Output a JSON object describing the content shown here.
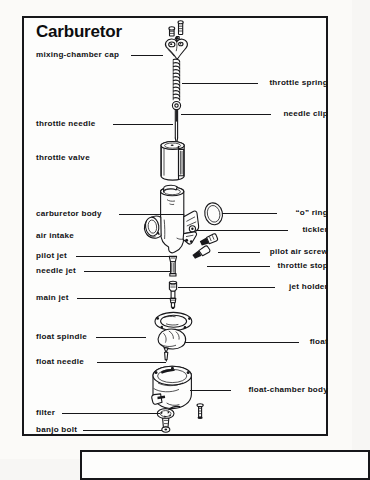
{
  "figure": {
    "title": "Carburetor",
    "labels_left": [
      {
        "text": "mixing-chamber cap",
        "leader": true
      },
      {
        "text": "throttle needle",
        "leader": true
      },
      {
        "text": "throttle valve",
        "leader": false
      },
      {
        "text": "carburetor body",
        "leader": true
      },
      {
        "text": "air intake",
        "leader": false
      },
      {
        "text": "pilot jet",
        "leader": true
      },
      {
        "text": "needle jet",
        "leader": true
      },
      {
        "text": "main jet",
        "leader": true
      },
      {
        "text": "float spindle",
        "leader": true
      },
      {
        "text": "float needle",
        "leader": true
      },
      {
        "text": "filter",
        "leader": true
      },
      {
        "text": "banjo bolt",
        "leader": true
      }
    ],
    "labels_right": [
      {
        "text": "throttle spring",
        "leader": true
      },
      {
        "text": "needle clip",
        "leader": true
      },
      {
        "text": "“o” ring",
        "leader": true
      },
      {
        "text": "tickler",
        "leader": true
      },
      {
        "text": "pilot air screw",
        "leader": true
      },
      {
        "text": "throttle stop",
        "leader": true
      },
      {
        "text": "jet holder",
        "leader": true
      },
      {
        "text": "float",
        "leader": true
      },
      {
        "text": "float-chamber body",
        "leader": true
      }
    ],
    "colors": {
      "ink": "#18181b",
      "paper": "#fdfdfc",
      "page": "#f7f6f4"
    }
  }
}
